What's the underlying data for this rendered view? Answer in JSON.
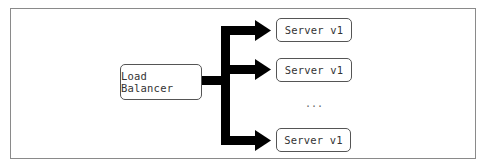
{
  "diagram": {
    "source": {
      "label": "Load Balancer"
    },
    "targets": [
      {
        "label": "Server v1"
      },
      {
        "label": "Server v1"
      },
      {
        "label": "Server v1"
      }
    ],
    "ellipsis": "...",
    "colors": {
      "arrow": "#000000",
      "border": "#555555",
      "frame": "#8a8a8a"
    }
  }
}
